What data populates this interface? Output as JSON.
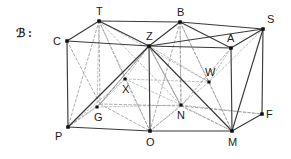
{
  "figure": {
    "margin_tag": "ℬ :",
    "stroke_solid": "#3a3a3a",
    "stroke_hidden": "#9a9a9a",
    "vertex_fill": "#111111",
    "background": "#ffffff",
    "width": 291,
    "height": 159
  },
  "vertices": [
    {
      "id": "T",
      "label": "T",
      "x": 99,
      "y": 21,
      "kind": "corner",
      "hidden": false,
      "label_dx": -3,
      "label_dy": -15
    },
    {
      "id": "B",
      "label": "B",
      "x": 180,
      "y": 22,
      "kind": "corner",
      "hidden": false,
      "label_dx": -3,
      "label_dy": -15
    },
    {
      "id": "S",
      "label": "S",
      "x": 263,
      "y": 29,
      "kind": "corner",
      "hidden": false,
      "label_dx": 4,
      "label_dy": -15
    },
    {
      "id": "C",
      "label": "C",
      "x": 67,
      "y": 41,
      "kind": "corner",
      "hidden": false,
      "label_dx": -14,
      "label_dy": -5
    },
    {
      "id": "Z",
      "label": "Z",
      "x": 149,
      "y": 46,
      "kind": "corner",
      "hidden": false,
      "label_dx": -3,
      "label_dy": -15
    },
    {
      "id": "A",
      "label": "A",
      "x": 231,
      "y": 48,
      "kind": "corner",
      "hidden": false,
      "label_dx": -4,
      "label_dy": -15
    },
    {
      "id": "P",
      "label": "P",
      "x": 68,
      "y": 127,
      "kind": "corner",
      "hidden": false,
      "label_dx": -13,
      "label_dy": 4
    },
    {
      "id": "O",
      "label": "O",
      "x": 150,
      "y": 131,
      "kind": "corner",
      "hidden": false,
      "label_dx": -4,
      "label_dy": 6
    },
    {
      "id": "M",
      "label": "M",
      "x": 232,
      "y": 131,
      "kind": "corner",
      "hidden": false,
      "label_dx": -4,
      "label_dy": 6
    },
    {
      "id": "F",
      "label": "F",
      "x": 262,
      "y": 114,
      "kind": "corner",
      "hidden": false,
      "label_dx": 4,
      "label_dy": -5
    },
    {
      "id": "X",
      "label": "X",
      "x": 125,
      "y": 79,
      "kind": "interior",
      "hidden": false,
      "label_dx": -3,
      "label_dy": 5
    },
    {
      "id": "W",
      "label": "W",
      "x": 209,
      "y": 82,
      "kind": "interior",
      "hidden": false,
      "label_dx": -4,
      "label_dy": -15
    },
    {
      "id": "G",
      "label": "G",
      "x": 97,
      "y": 107,
      "kind": "interior",
      "hidden": false,
      "label_dx": -3,
      "label_dy": 5
    },
    {
      "id": "N",
      "label": "N",
      "x": 181,
      "y": 105,
      "kind": "interior",
      "hidden": false,
      "label_dx": -4,
      "label_dy": 5
    }
  ],
  "hidden_vertices": [
    {
      "id": "T_back_bottom",
      "x": 100,
      "y": 104
    },
    {
      "id": "B_back_bottom",
      "x": 181,
      "y": 106
    },
    {
      "id": "S_back_bottom",
      "x": 262,
      "y": 114
    }
  ],
  "edges_solid": [
    {
      "from": "T",
      "to": "B"
    },
    {
      "from": "B",
      "to": "S"
    },
    {
      "from": "T",
      "to": "C"
    },
    {
      "from": "T",
      "to": "Z"
    },
    {
      "from": "B",
      "to": "Z"
    },
    {
      "from": "B",
      "to": "A"
    },
    {
      "from": "S",
      "to": "A"
    },
    {
      "from": "S",
      "to": "Z"
    },
    {
      "from": "C",
      "to": "Z"
    },
    {
      "from": "Z",
      "to": "A"
    },
    {
      "from": "C",
      "to": "P"
    },
    {
      "from": "Z",
      "to": "O"
    },
    {
      "from": "A",
      "to": "M"
    },
    {
      "from": "P",
      "to": "O"
    },
    {
      "from": "O",
      "to": "M"
    },
    {
      "from": "M",
      "to": "F"
    },
    {
      "from": "S",
      "to": "F"
    },
    {
      "from": "S",
      "to": "M"
    },
    {
      "from": "P",
      "to": "Z"
    },
    {
      "from": "Z",
      "to": "M"
    }
  ],
  "edges_hidden": [
    {
      "from": "T",
      "to": "T_back_bottom"
    },
    {
      "from": "B",
      "to": "B_back_bottom"
    },
    {
      "from": "T_back_bottom",
      "to": "B_back_bottom"
    },
    {
      "from": "B_back_bottom",
      "to": "S_back_bottom"
    },
    {
      "from": "T_back_bottom",
      "to": "P"
    },
    {
      "from": "B_back_bottom",
      "to": "O"
    },
    {
      "from": "T_back_bottom",
      "to": "O"
    },
    {
      "from": "B_back_bottom",
      "to": "M"
    },
    {
      "from": "T_back_bottom",
      "to": "Z"
    },
    {
      "from": "B_back_bottom",
      "to": "Z"
    },
    {
      "from": "T",
      "to": "P"
    },
    {
      "from": "T",
      "to": "O"
    },
    {
      "from": "B",
      "to": "O"
    },
    {
      "from": "B",
      "to": "M"
    },
    {
      "from": "C",
      "to": "T_back_bottom"
    },
    {
      "from": "A",
      "to": "B_back_bottom"
    },
    {
      "from": "Z",
      "to": "B_back_bottom"
    },
    {
      "from": "Z",
      "to": "T_back_bottom"
    }
  ],
  "interior_rays": [
    {
      "from": "T",
      "to": "X"
    },
    {
      "from": "T",
      "to": "G"
    },
    {
      "from": "T",
      "to": "N"
    },
    {
      "from": "T",
      "to": "W"
    },
    {
      "from": "Z",
      "to": "X"
    },
    {
      "from": "Z",
      "to": "G"
    },
    {
      "from": "Z",
      "to": "N"
    },
    {
      "from": "Z",
      "to": "W"
    },
    {
      "from": "P",
      "to": "X"
    },
    {
      "from": "P",
      "to": "G"
    },
    {
      "from": "O",
      "to": "N"
    },
    {
      "from": "O",
      "to": "X"
    },
    {
      "from": "M",
      "to": "N"
    },
    {
      "from": "M",
      "to": "W"
    },
    {
      "from": "S",
      "to": "W"
    },
    {
      "from": "A",
      "to": "W"
    },
    {
      "from": "B",
      "to": "N"
    },
    {
      "from": "B",
      "to": "W"
    },
    {
      "from": "G",
      "to": "N"
    },
    {
      "from": "N",
      "to": "F"
    },
    {
      "from": "G",
      "to": "X"
    },
    {
      "from": "X",
      "to": "N"
    },
    {
      "from": "N",
      "to": "W"
    },
    {
      "from": "X",
      "to": "W"
    }
  ]
}
